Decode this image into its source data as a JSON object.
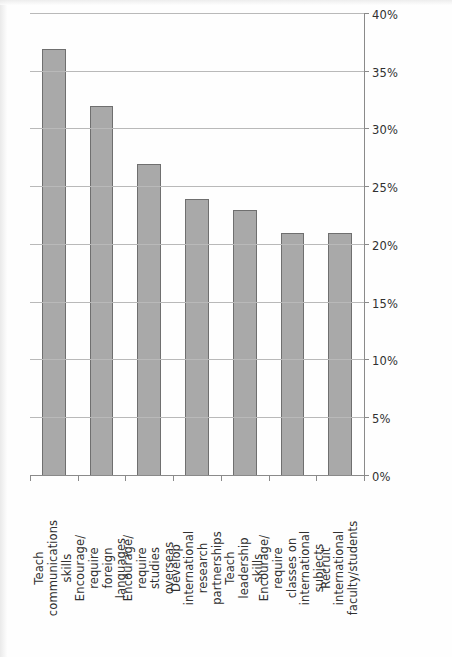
{
  "chart_data": {
    "type": "bar",
    "orientation": "horizontal",
    "title": "",
    "subtitle": "",
    "xlabel": "",
    "ylabel": "",
    "xlim": [
      0,
      40
    ],
    "xtick_labels": [
      "0%",
      "5%",
      "10%",
      "15%",
      "20%",
      "25%",
      "30%",
      "35%",
      "40%"
    ],
    "xtick_values": [
      0,
      5,
      10,
      15,
      20,
      25,
      30,
      35,
      40
    ],
    "grid": true,
    "legend": false,
    "legend_position": "none",
    "page_rotation_degrees": -90,
    "bar_fill_color": "#a9a9a9",
    "bar_border_color": "#6f6f6f",
    "gridline_color": "#b9b9b9",
    "axis_color": "#8a8a8a",
    "categories": [
      "Teach communications skills",
      "Encourage/ require foreign languages",
      "Encourage/ require studies overseas",
      "Develop international research partnerships",
      "Teach leadership skills",
      "Encourage/ require classes on international subjects",
      "Recruit international faculty/students"
    ],
    "category_lines": [
      [
        "Teach",
        "communications",
        "skills"
      ],
      [
        "Encourage/",
        "require",
        "foreign",
        "languages"
      ],
      [
        "Encourage/",
        "require",
        "studies",
        "overseas"
      ],
      [
        "Develop",
        "international",
        "research",
        "partnerships"
      ],
      [
        "Teach",
        "leadership",
        "skills"
      ],
      [
        "Encourage/",
        "require",
        "classes on",
        "international",
        "subjects"
      ],
      [
        "Recruit",
        "international",
        "faculty/students"
      ]
    ],
    "values": [
      37,
      32,
      27,
      24,
      23,
      21,
      21
    ],
    "series": [
      {
        "name": "Share of respondents",
        "values": [
          37,
          32,
          27,
          24,
          23,
          21,
          21
        ]
      }
    ]
  }
}
